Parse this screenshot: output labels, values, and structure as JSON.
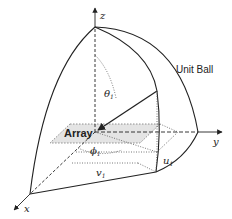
{
  "diagram": {
    "title_label": "Unit Ball",
    "array_label": "Array",
    "axes": {
      "x": "x",
      "y": "y",
      "z": "z"
    },
    "angles": {
      "theta": "θ",
      "theta_sub": "1",
      "phi": "ϕ",
      "phi_sub": "1"
    },
    "coords": {
      "u": "u",
      "u_sub": "1",
      "v": "v",
      "v_sub": "1"
    },
    "colors": {
      "line": "#222222",
      "array_fill": "#e4e4e4",
      "dotted": "#555555"
    }
  }
}
